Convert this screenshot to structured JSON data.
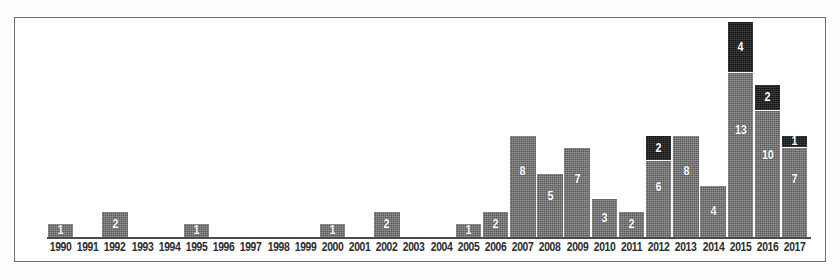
{
  "figure": {
    "background_color": "#fdfdfd",
    "panel_color": "#ffffff",
    "border_color": "#6e6e72"
  },
  "chart_data": {
    "type": "bar",
    "title": "",
    "subtitle": "",
    "xlabel": "",
    "ylabel": "",
    "grid": false,
    "legend": false,
    "legend_position": "none",
    "stacked": true,
    "ylim": [
      0,
      17
    ],
    "bar_label_color": "#ffffff",
    "categories": [
      "1990",
      "1991",
      "1992",
      "1993",
      "1994",
      "1995",
      "1996",
      "1997",
      "1998",
      "1999",
      "2000",
      "2001",
      "2002",
      "2003",
      "2004",
      "2005",
      "2006",
      "2007",
      "2008",
      "2009",
      "2010",
      "2011",
      "2012",
      "2013",
      "2014",
      "2015",
      "2016",
      "2017"
    ],
    "series": [
      {
        "name": "grey-series",
        "color": "#6d6d6d",
        "values": [
          1,
          0,
          2,
          0,
          0,
          1,
          0,
          0,
          0,
          0,
          1,
          0,
          2,
          0,
          0,
          1,
          2,
          8,
          5,
          7,
          3,
          2,
          6,
          8,
          4,
          13,
          10,
          7
        ]
      },
      {
        "name": "black-series",
        "color": "#191919",
        "values": [
          0,
          0,
          0,
          0,
          0,
          0,
          0,
          0,
          0,
          0,
          0,
          0,
          0,
          0,
          0,
          0,
          0,
          0,
          0,
          0,
          0,
          0,
          2,
          0,
          0,
          4,
          2,
          1
        ]
      }
    ],
    "totals": [
      1,
      0,
      2,
      0,
      0,
      1,
      0,
      0,
      0,
      0,
      1,
      0,
      2,
      0,
      0,
      1,
      2,
      8,
      5,
      7,
      3,
      2,
      8,
      8,
      4,
      17,
      12,
      8
    ]
  }
}
